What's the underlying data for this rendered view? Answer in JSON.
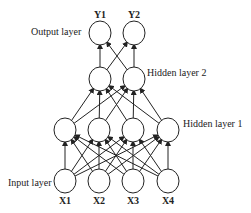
{
  "diagram": {
    "type": "feed-forward neural network",
    "layers": [
      {
        "name": "Input layer",
        "label_pos": [
          8,
          186
        ],
        "nodes": [
          {
            "label": "X1",
            "cx": 65,
            "cy": 181
          },
          {
            "label": "X2",
            "cx": 99,
            "cy": 181
          },
          {
            "label": "X3",
            "cx": 133,
            "cy": 181
          },
          {
            "label": "X4",
            "cx": 168,
            "cy": 181
          }
        ]
      },
      {
        "name": "Hidden layer 1",
        "label_pos": [
          183,
          127
        ],
        "nodes": [
          {
            "cx": 65,
            "cy": 130
          },
          {
            "cx": 99,
            "cy": 130
          },
          {
            "cx": 133,
            "cy": 130
          },
          {
            "cx": 168,
            "cy": 130
          }
        ]
      },
      {
        "name": "Hidden layer 2",
        "label_pos": [
          147,
          76
        ],
        "nodes": [
          {
            "cx": 100,
            "cy": 79
          },
          {
            "cx": 134,
            "cy": 79
          }
        ]
      },
      {
        "name": "Output layer",
        "label_pos": [
          31,
          35
        ],
        "nodes": [
          {
            "label": "Y1",
            "cx": 100,
            "cy": 33
          },
          {
            "label": "Y2",
            "cx": 134,
            "cy": 33
          }
        ]
      }
    ],
    "node_radius": 11,
    "stroke": "#222222"
  }
}
